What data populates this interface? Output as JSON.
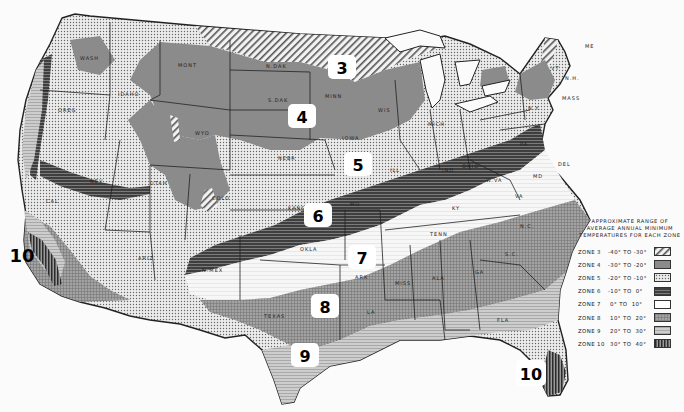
{
  "map": {
    "title": "USDA Plant Hardiness Zones (Approximate Range of Average Annual Minimum Temperatures)",
    "zone_markers": [
      {
        "zone": "3",
        "x": 342,
        "y": 67
      },
      {
        "zone": "4",
        "x": 302,
        "y": 117
      },
      {
        "zone": "5",
        "x": 358,
        "y": 165
      },
      {
        "zone": "6",
        "x": 318,
        "y": 215
      },
      {
        "zone": "7",
        "x": 362,
        "y": 257
      },
      {
        "zone": "8",
        "x": 325,
        "y": 306
      },
      {
        "zone": "9",
        "x": 305,
        "y": 355
      },
      {
        "zone": "10",
        "x": 22,
        "y": 255
      },
      {
        "zone": "10",
        "x": 531,
        "y": 373
      }
    ],
    "state_labels": [
      "WASH",
      "OREG",
      "IDAHO",
      "MONT",
      "WYO",
      "NEV",
      "UTAH",
      "COLO",
      "CAL",
      "ARIZ",
      "N.MEX",
      "N.DAK",
      "S.DAK",
      "NEBR",
      "KANS",
      "OKLA",
      "TEXAS",
      "MINN",
      "IOWA",
      "MO",
      "ARK",
      "LA",
      "WIS",
      "ILL",
      "MICH",
      "IND",
      "OHIO",
      "KY",
      "TENN",
      "MISS",
      "ALA",
      "GA",
      "FLA",
      "S.C.",
      "N.C.",
      "VA",
      "W.VA",
      "PA",
      "N.Y.",
      "VT",
      "N.H.",
      "ME",
      "MASS",
      "MD",
      "DEL"
    ]
  },
  "legend": {
    "title_lines": [
      "APPROXIMATE RANGE OF",
      "AVERAGE ANNUAL MINIMUM",
      "TEMPERATURES FOR EACH ZONE"
    ],
    "rows": [
      {
        "zone": "ZONE 3",
        "range": "-40° TO -30°",
        "pattern": "diagonal-hatch"
      },
      {
        "zone": "ZONE 4",
        "range": "-30° TO -20°",
        "pattern": "solid-gray"
      },
      {
        "zone": "ZONE 5",
        "range": "-20° TO -10°",
        "pattern": "dots"
      },
      {
        "zone": "ZONE 6",
        "range": "-10° TO  0°",
        "pattern": "dark-horizontal"
      },
      {
        "zone": "ZONE 7",
        "range": " 0° TO  10°",
        "pattern": "white"
      },
      {
        "zone": "ZONE 8",
        "range": " 10° TO  20°",
        "pattern": "crosshatch-gray"
      },
      {
        "zone": "ZONE 9",
        "range": " 20° TO  30°",
        "pattern": "light-horizontal"
      },
      {
        "zone": "ZONE 10",
        "range": " 30° TO  40°",
        "pattern": "vertical-dark"
      }
    ]
  },
  "colors": {
    "zone3": "#d8d8d8",
    "zone4": "#8a8a8a",
    "zone5": "#d9d9d9",
    "zone6": "#4a4a4a",
    "zone7": "#f4f4f4",
    "zone8": "#9c9c9c",
    "zone9": "#c4c4c4",
    "zone10": "#3a3a3a",
    "border": "#222222"
  }
}
